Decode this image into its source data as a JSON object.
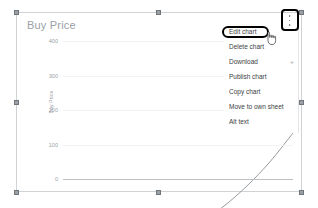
{
  "chart_object": {
    "title": "Buy Price",
    "selected": true,
    "handles": [
      "top-left",
      "top-center",
      "top-right",
      "middle-left",
      "middle-right",
      "bottom-left",
      "bottom-center",
      "bottom-right"
    ]
  },
  "overflow_button": {
    "icon": "more-vert-icon",
    "highlighted": true,
    "highlight_color": "#000000"
  },
  "context_menu": {
    "items": [
      {
        "label": "Edit chart",
        "highlighted": true,
        "submenu": false
      },
      {
        "label": "Delete chart",
        "highlighted": false,
        "submenu": false
      },
      {
        "label": "Download",
        "highlighted": false,
        "submenu": true,
        "submenu_glyph": "▸"
      },
      {
        "label": "Publish chart",
        "highlighted": false,
        "submenu": false
      },
      {
        "label": "Copy chart",
        "highlighted": false,
        "submenu": false
      },
      {
        "label": "Move to own sheet",
        "highlighted": false,
        "submenu": false
      },
      {
        "label": "Alt text",
        "highlighted": false,
        "submenu": false
      }
    ]
  },
  "cursor": {
    "type": "pointer-hand-icon"
  },
  "chart_data": {
    "type": "line",
    "title": "Buy Price",
    "xlabel": "",
    "ylabel": "Buy Price",
    "ylim": [
      0,
      400
    ],
    "yticks": [
      400,
      300,
      200,
      100,
      0
    ],
    "ytick_labels": [
      "400",
      "300",
      "200",
      "100",
      "0"
    ],
    "grid": true,
    "legend": "none",
    "series": [
      {
        "name": "Buy Price",
        "x": [
          0,
          1,
          2,
          3,
          4,
          5,
          6,
          7,
          8,
          9,
          10
        ],
        "values": [
          10,
          15,
          22,
          32,
          45,
          62,
          85,
          113,
          148,
          190,
          240
        ]
      }
    ]
  }
}
